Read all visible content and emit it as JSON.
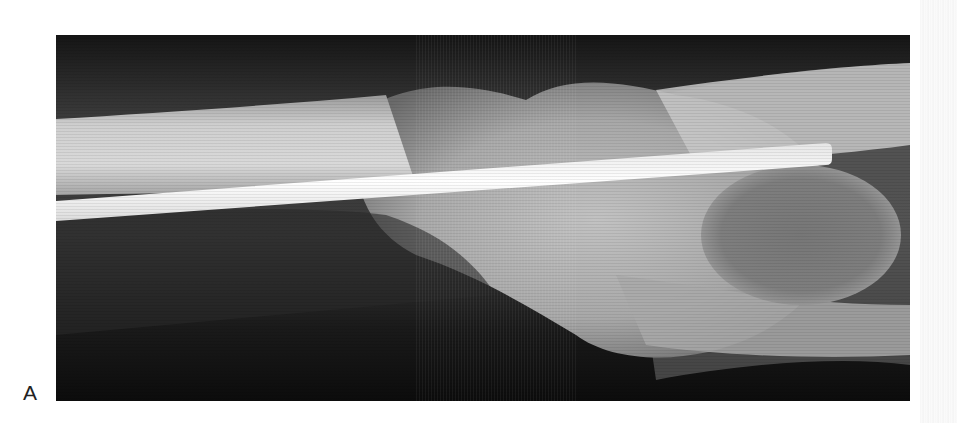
{
  "figure": {
    "panel_label": "A",
    "colors": {
      "background": "#ffffff",
      "soft_tissue_dark": "#1a1a1a",
      "bone": "#c8c8c8",
      "rod": "#f4f4f4"
    }
  }
}
